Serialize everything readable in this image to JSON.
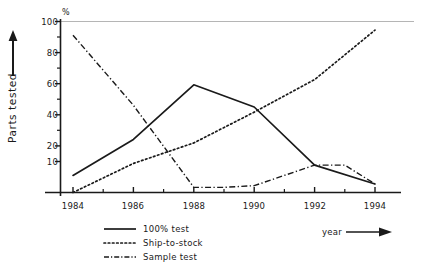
{
  "chart_data": {
    "type": "line",
    "title": "",
    "xlabel": "year",
    "ylabel": "Parts tested",
    "yunit": "%",
    "xlim": [
      1984,
      1994
    ],
    "ylim": [
      0,
      100
    ],
    "grid": false,
    "legend_position": "below-left",
    "x_ticks": [
      "1984",
      "1986",
      "1988",
      "1990",
      "1992",
      "1994"
    ],
    "x_tick_values": [
      1984,
      1986,
      1988,
      1990,
      1992,
      1994
    ],
    "x_minor_ticks": [
      1985,
      1987,
      1989,
      1991,
      1993
    ],
    "y_ticks": [
      "10",
      "20",
      "40",
      "60",
      "80",
      "100"
    ],
    "y_tick_values": [
      10,
      20,
      40,
      60,
      80,
      100
    ],
    "y_minor_ticks": [
      30,
      50,
      70,
      90
    ],
    "series": [
      {
        "name": "100% test",
        "style": "solid",
        "x": [
          1984,
          1986,
          1988,
          1990,
          1992,
          1994
        ],
        "values": [
          10,
          31,
          63,
          50,
          16,
          5
        ]
      },
      {
        "name": "Ship-to-stock",
        "style": "dotted",
        "x": [
          1984,
          1986,
          1988,
          1990,
          1992,
          1994
        ],
        "values": [
          0,
          17,
          29,
          47,
          66,
          95
        ]
      },
      {
        "name": "Sample test",
        "style": "dash-dot",
        "x": [
          1984,
          1986,
          1988,
          1989,
          1990,
          1992,
          1993,
          1994
        ],
        "values": [
          92,
          51,
          3,
          3,
          4,
          16,
          16,
          5
        ]
      }
    ]
  },
  "axes": {
    "y_unit_symbol": "%",
    "y_title": "Parts tested",
    "x_title": "year",
    "y_tick_labels": [
      "100",
      "80",
      "60",
      "40",
      "20",
      "10"
    ],
    "x_tick_labels": [
      "1984",
      "1986",
      "1988",
      "1990",
      "1992",
      "1994"
    ]
  },
  "legend": {
    "items": [
      {
        "label": "100% test",
        "style": "solid"
      },
      {
        "label": "Ship-to-stock",
        "style": "dotted"
      },
      {
        "label": "Sample test",
        "style": "dash-dot"
      }
    ]
  },
  "colors": {
    "ink": "#1a1a1a",
    "reference_line": "#b5b5b5",
    "background": "#ffffff"
  }
}
